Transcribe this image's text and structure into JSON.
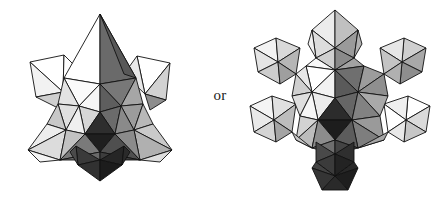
{
  "canvas": {
    "width": 440,
    "height": 197,
    "background": "#ffffff"
  },
  "conjunction": {
    "label": "or"
  },
  "figures": [
    {
      "id": "left-figure",
      "name": "stellated-icosahedral-cluster",
      "caption": "",
      "bounds": {
        "x": 25,
        "y": 14,
        "width": 156,
        "height": 166
      },
      "outline_color": "#111111"
    },
    {
      "id": "right-figure",
      "name": "octahedra-decorated-icosahedral-cluster",
      "caption": "",
      "bounds": {
        "x": 255,
        "y": 10,
        "width": 176,
        "height": 180
      },
      "outline_color": "#111111"
    }
  ],
  "palette": {
    "white": "#ffffff",
    "near_white": "#f2f2f2",
    "light_gray": "#d8d8d8",
    "gray": "#b4b4b4",
    "mid_gray": "#969696",
    "dark_gray": "#6e6e6e",
    "darker_gray": "#4a4a4a",
    "near_black": "#2b2b2b",
    "black": "#141414",
    "outline": "#111111"
  }
}
